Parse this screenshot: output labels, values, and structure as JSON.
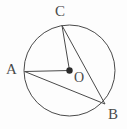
{
  "figure": {
    "kind": "circle-geometry-diagram",
    "background_color": "#fdfdfd",
    "stroke_color": "#4a4a4a",
    "label_color": "#4a4a4a",
    "circle": {
      "name": "circle-O",
      "center_x": 69.5,
      "center_y": 70.5,
      "radius": 45.5,
      "stroke_width": 1
    },
    "center_point": {
      "name": "center-point-O",
      "x": 69.5,
      "y": 70.5,
      "radius": 3.2
    },
    "points": [
      {
        "id": "C",
        "label": "C",
        "x": 62,
        "y": 25.5
      },
      {
        "id": "A",
        "label": "A",
        "x": 24.6,
        "y": 71.5
      },
      {
        "id": "B",
        "label": "B",
        "x": 105,
        "y": 104
      },
      {
        "id": "O",
        "label": "O",
        "x": 69.5,
        "y": 70.5
      }
    ],
    "segments": [
      {
        "id": "AO",
        "from": "A",
        "to": "O",
        "x1": 24.6,
        "y1": 71.5,
        "x2": 69.5,
        "y2": 70.5
      },
      {
        "id": "AB",
        "from": "A",
        "to": "B",
        "x1": 24.6,
        "y1": 71.5,
        "x2": 105,
        "y2": 104
      },
      {
        "id": "CO",
        "from": "C",
        "to": "O",
        "x1": 62,
        "y1": 25.5,
        "x2": 69.5,
        "y2": 70.5
      },
      {
        "id": "CB",
        "from": "C",
        "to": "B",
        "x1": 62,
        "y1": 25.5,
        "x2": 105,
        "y2": 104
      }
    ],
    "labels": {
      "C": "C",
      "A": "A",
      "B": "B",
      "O": "O"
    }
  }
}
